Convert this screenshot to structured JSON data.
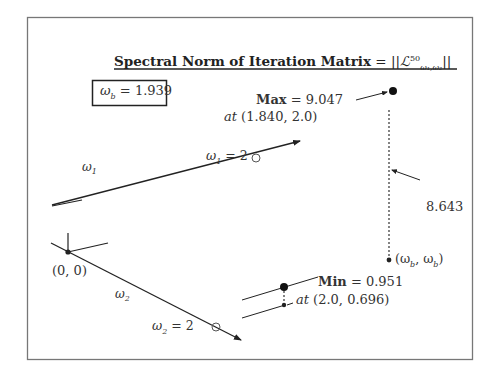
{
  "diagram": {
    "title": {
      "text": "Spectral Norm of Iteration Matrix",
      "equals": " = ||",
      "symbol": "ℒ",
      "superscript": "50",
      "subscript": "ω₁,ω₂",
      "close": "||"
    },
    "omega_b_box": {
      "label": "ω",
      "sub": "b",
      "value": " = 1.939"
    },
    "max": {
      "label": "Max",
      "value": " = 9.047",
      "at_label": "at",
      "at_coords": " (1.840,  2.0)"
    },
    "min": {
      "label": "Min",
      "value": " = 0.951",
      "at_label": "at",
      "at_coords": " (2.0,  0.696)"
    },
    "difference": {
      "value": "8.643"
    },
    "diagonal_point": {
      "label": "(ω",
      "sub1": "b",
      "mid": ", ω",
      "sub2": "b",
      "close": ")"
    },
    "axes": {
      "omega1": {
        "label": "ω",
        "sub": "1",
        "marker_label": "ω",
        "marker_sub": "1",
        "marker_value": " = 2"
      },
      "omega2": {
        "label": "ω",
        "sub": "2",
        "marker_label": "ω",
        "marker_sub": "2",
        "marker_value": " = 2"
      },
      "origin": "(0, 0)"
    },
    "colors": {
      "ink": "#222222",
      "frame": "#777777",
      "background": "#ffffff"
    }
  }
}
